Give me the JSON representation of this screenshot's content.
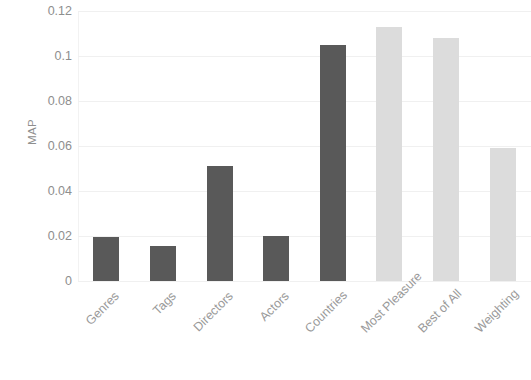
{
  "chart_data": {
    "type": "bar",
    "title": "",
    "subtitle": "",
    "xlabel": "",
    "ylabel": "MAP",
    "categories": [
      "Genres",
      "Tags",
      "Directors",
      "Actors",
      "Countries",
      "Most Pleasure",
      "Best of All",
      "Weighting"
    ],
    "values": [
      0.0195,
      0.0155,
      0.051,
      0.02,
      0.105,
      0.113,
      0.108,
      0.059
    ],
    "bar_colors": [
      "#595959",
      "#595959",
      "#595959",
      "#595959",
      "#595959",
      "#dcdcdc",
      "#dcdcdc",
      "#dcdcdc"
    ],
    "ylim": [
      0,
      0.12
    ],
    "yticks": [
      0,
      0.02,
      0.04,
      0.06,
      0.08,
      0.1,
      0.12
    ],
    "ytick_labels": [
      "0",
      "0.02",
      "0.04",
      "0.06",
      "0.08",
      "0.1",
      "0.12"
    ],
    "grid": true,
    "grid_axis": "y",
    "legend": false,
    "legend_position": "none",
    "xtick_rotation": -45,
    "series": [
      {
        "name": "MAP",
        "values": [
          0.0195,
          0.0155,
          0.051,
          0.02,
          0.105,
          0.113,
          0.108,
          0.059
        ]
      }
    ],
    "colors": {
      "dark_bar": "#595959",
      "light_bar": "#dcdcdc",
      "gridline": "#f0f0f0",
      "tick_text": "#8e8e8e",
      "axis_title": "#8e8e8e",
      "background": "#ffffff"
    }
  }
}
